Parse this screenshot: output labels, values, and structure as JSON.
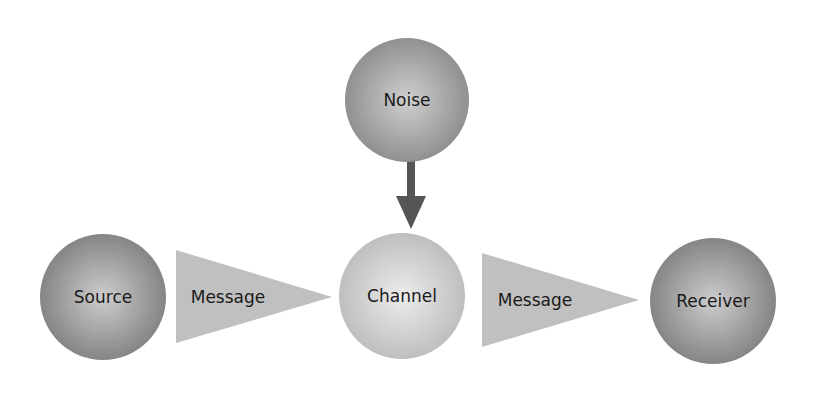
{
  "diagram": {
    "title": "",
    "nodes": [
      {
        "id": "noise",
        "label": "Noise",
        "cx": 407,
        "cy": 100,
        "r": 62,
        "fill_center": "#c8c8c8",
        "fill_edge": "#8e8e8e"
      },
      {
        "id": "source",
        "label": "Source",
        "cx": 103,
        "cy": 297,
        "r": 63,
        "fill_center": "#c4c4c4",
        "fill_edge": "#858585"
      },
      {
        "id": "channel",
        "label": "Channel",
        "cx": 402,
        "cy": 296,
        "r": 63,
        "fill_center": "#e2e2e2",
        "fill_edge": "#bdbdbd"
      },
      {
        "id": "receiver",
        "label": "Receiver",
        "cx": 713,
        "cy": 301,
        "r": 63,
        "fill_center": "#c4c4c4",
        "fill_edge": "#858585"
      }
    ],
    "edges": [
      {
        "id": "message-1",
        "label": "Message",
        "from": "source",
        "to": "channel",
        "shape": "triangle",
        "fill": "#bfbfbf"
      },
      {
        "id": "message-2",
        "label": "Message",
        "from": "channel",
        "to": "receiver",
        "shape": "triangle",
        "fill": "#bfbfbf"
      },
      {
        "id": "noise-arrow",
        "label": "",
        "from": "noise",
        "to": "channel",
        "shape": "arrow",
        "fill": "#555555"
      }
    ]
  }
}
